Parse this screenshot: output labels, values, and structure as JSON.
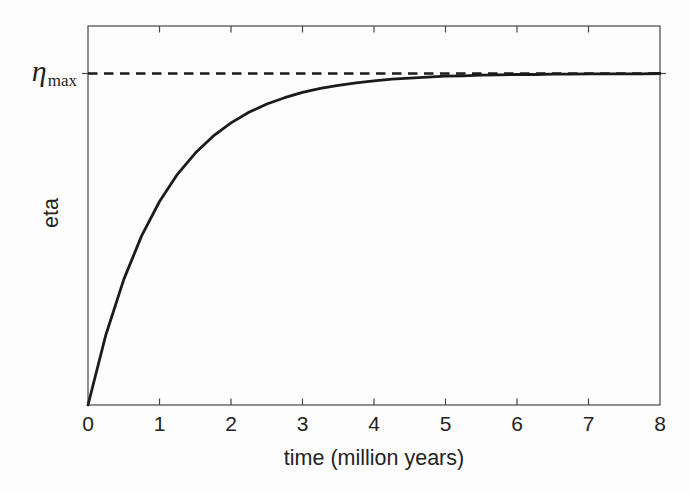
{
  "figure": {
    "ylabel": "eta",
    "xlabel": "time (million years)",
    "asymptote_label": {
      "base": "η",
      "subscript": "max"
    }
  },
  "chart_data": {
    "type": "line",
    "title": "",
    "xlabel": "time (million years)",
    "ylabel": "eta",
    "xlim": [
      0,
      8
    ],
    "ylim_normalized": [
      0,
      1.145
    ],
    "x_ticks": [
      0,
      1,
      2,
      3,
      4,
      5,
      6,
      7,
      8
    ],
    "x_tick_labels": [
      "0",
      "1",
      "2",
      "3",
      "4",
      "5",
      "6",
      "7",
      "8"
    ],
    "y_ticks_marked_at": [
      "eta_max"
    ],
    "grid": false,
    "legend": "none",
    "asymptote": {
      "label": "η_max",
      "value": 1.0,
      "style": "dashed"
    },
    "series": [
      {
        "name": "eta (normalized to eta_max), saturating growth curve",
        "style": "solid",
        "x": [
          0,
          0.25,
          0.5,
          0.75,
          1,
          1.25,
          1.5,
          1.75,
          2,
          2.25,
          2.5,
          2.75,
          3,
          3.25,
          3.5,
          3.75,
          4,
          4.25,
          4.5,
          4.75,
          5,
          5.25,
          5.5,
          5.75,
          6,
          6.25,
          6.5,
          6.75,
          7,
          7.25,
          7.5,
          7.75,
          8
        ],
        "y": [
          0,
          0.212,
          0.379,
          0.51,
          0.614,
          0.696,
          0.76,
          0.811,
          0.851,
          0.883,
          0.908,
          0.927,
          0.943,
          0.955,
          0.964,
          0.972,
          0.978,
          0.983,
          0.986,
          0.989,
          0.992,
          0.993,
          0.995,
          0.996,
          0.997,
          0.997,
          0.998,
          0.998,
          0.999,
          0.999,
          0.999,
          0.999,
          1.0
        ]
      }
    ]
  },
  "colors": {
    "line": "#1b1b1b",
    "frame": "#474747",
    "text": "#232323",
    "background": "#fdfdfd"
  }
}
